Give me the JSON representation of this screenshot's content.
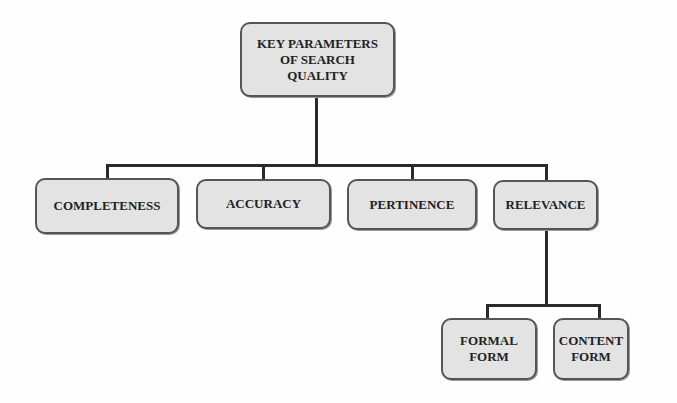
{
  "diagram": {
    "type": "hierarchy",
    "root": {
      "label": "KEY PARAMETERS\nOF SEARCH\nQUALITY",
      "children": [
        {
          "label": "COMPLETENESS"
        },
        {
          "label": "ACCURACY"
        },
        {
          "label": "PERTINENCE"
        },
        {
          "label": "RELEVANCE",
          "children": [
            {
              "label": "FORMAL\nFORM"
            },
            {
              "label": "CONTENT\nFORM"
            }
          ]
        }
      ]
    }
  },
  "nodes": {
    "root": "KEY PARAMETERS\nOF SEARCH\nQUALITY",
    "completeness": "COMPLETENESS",
    "accuracy": "ACCURACY",
    "pertinence": "PERTINENCE",
    "relevance": "RELEVANCE",
    "formal_form": "FORMAL\nFORM",
    "content_form": "CONTENT\nFORM"
  },
  "colors": {
    "box_fill": "#e3e3e3",
    "box_border": "#555555",
    "connector": "#2a2a2a"
  }
}
